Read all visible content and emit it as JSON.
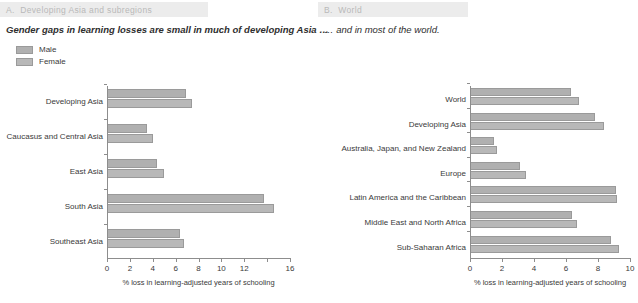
{
  "chart_data": [
    {
      "type": "bar",
      "panel_id": "A.",
      "panel_title": "Developing Asia and subregions",
      "subtitle": "Gender gaps in learning losses are small in much of developing Asia …",
      "orientation": "horizontal",
      "grid": false,
      "legend_position": "top-left",
      "xlabel": "% loss in learning-adjusted years of schooling",
      "ylabel": "",
      "xlim": [
        0,
        16
      ],
      "xticks": [
        0,
        2,
        4,
        6,
        8,
        10,
        12,
        16
      ],
      "xtick_labels": [
        "0",
        "2",
        "4",
        "6",
        "8",
        "10",
        "12",
        "16"
      ],
      "categories": [
        "Developing Asia",
        "Caucasus and Central Asia",
        "East Asia",
        "South Asia",
        "Southeast Asia"
      ],
      "series": [
        {
          "name": "Male",
          "color": "#b0b0b0",
          "values": [
            6.9,
            3.5,
            4.4,
            13.7,
            6.4
          ]
        },
        {
          "name": "Female",
          "color": "#b8b8b8",
          "values": [
            7.4,
            4.0,
            5.0,
            14.6,
            6.7
          ]
        }
      ]
    },
    {
      "type": "bar",
      "panel_id": "B.",
      "panel_title": "World",
      "subtitle": "… and in most of the world.",
      "orientation": "horizontal",
      "grid": false,
      "legend_position": "none",
      "xlabel": "% loss in learning-adjusted years of schooling",
      "ylabel": "",
      "xlim": [
        0,
        10
      ],
      "xticks": [
        0,
        2,
        4,
        6,
        8,
        10
      ],
      "xtick_labels": [
        "0",
        "2",
        "4",
        "6",
        "8",
        "10"
      ],
      "categories": [
        "World",
        "Developing Asia",
        "Australia, Japan, and New Zealand",
        "Europe",
        "Latin America and the Caribbean",
        "Middle East and North Africa",
        "Sub-Saharan Africa"
      ],
      "series": [
        {
          "name": "Male",
          "color": "#b0b0b0",
          "values": [
            6.3,
            7.8,
            1.5,
            3.1,
            9.1,
            6.4,
            8.8
          ]
        },
        {
          "name": "Female",
          "color": "#b8b8b8",
          "values": [
            6.8,
            8.4,
            1.7,
            3.5,
            9.2,
            6.7,
            9.3
          ]
        }
      ]
    }
  ],
  "legend": {
    "items": [
      {
        "label": "Male",
        "color": "#b0b0b0"
      },
      {
        "label": "Female",
        "color": "#b8b8b8"
      }
    ]
  },
  "colors": {
    "header_band": "#ececec",
    "header_text": "#b9b9b9",
    "axis": "#8d8d8d",
    "text": "#3a3a3a",
    "male": "#b0b0b0",
    "female": "#b8b8b8"
  }
}
